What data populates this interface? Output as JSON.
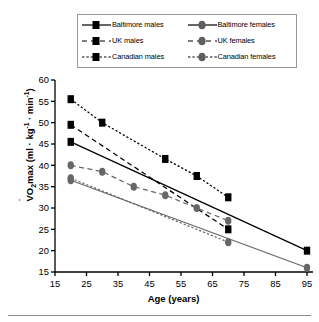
{
  "chart_data": {
    "type": "line",
    "title": "",
    "xlabel": "Age (years)",
    "ylabel": "VO2max (ml · kg-1 · min-1)",
    "ylabel_main": "O",
    "ylabel_pre": "V",
    "ylabel_sub": "2",
    "ylabel_rest": "max (ml · kg",
    "ylabel_sup1": "-1",
    "ylabel_mid": " · min",
    "ylabel_sup2": "-1",
    "ylabel_end": ")",
    "xlim": [
      15,
      95
    ],
    "ylim": [
      15,
      60
    ],
    "xticks": [
      15,
      25,
      35,
      45,
      55,
      65,
      75,
      85,
      95
    ],
    "yticks": [
      15,
      20,
      25,
      30,
      35,
      40,
      45,
      50,
      55,
      60
    ],
    "grid": false,
    "legend_position": "top-center",
    "series": [
      {
        "name": "Baltimore males",
        "marker": "square",
        "color": "#000000",
        "linestyle": "solid",
        "x": [
          20,
          95
        ],
        "y": [
          45.5,
          20.0
        ]
      },
      {
        "name": "UK males",
        "marker": "square",
        "color": "#000000",
        "linestyle": "dashed",
        "x": [
          20,
          70
        ],
        "y": [
          49.5,
          25.0
        ]
      },
      {
        "name": "Canadian males",
        "marker": "square",
        "color": "#000000",
        "linestyle": "dotted",
        "x": [
          20,
          30,
          50,
          60,
          70
        ],
        "y": [
          55.5,
          50.0,
          41.5,
          37.5,
          32.5
        ]
      },
      {
        "name": "Baltimore females",
        "marker": "circle",
        "color": "#676767",
        "linestyle": "solid",
        "x": [
          20,
          95
        ],
        "y": [
          36.5,
          16.0
        ]
      },
      {
        "name": "UK females",
        "marker": "circle",
        "color": "#676767",
        "linestyle": "dashed",
        "x": [
          20,
          30,
          40,
          50,
          60,
          70
        ],
        "y": [
          40.0,
          38.5,
          35.0,
          33.0,
          30.0,
          27.0
        ]
      },
      {
        "name": "Canadian females",
        "marker": "circle",
        "color": "#676767",
        "linestyle": "dotted",
        "x": [
          20,
          70
        ],
        "y": [
          37.0,
          22.0
        ]
      }
    ]
  },
  "legend": {
    "items": [
      {
        "label": "Baltimore males",
        "key": "solid-square-key"
      },
      {
        "label": "Baltimore females",
        "key": "solid-circle-key"
      },
      {
        "label": "UK males",
        "key": "dashed-square-key"
      },
      {
        "label": "UK females",
        "key": "dashed-circle-key"
      },
      {
        "label": "Canadian males",
        "key": "dotted-square-key"
      },
      {
        "label": "Canadian females",
        "key": "dotted-circle-key"
      }
    ]
  },
  "axes": {
    "x_title": "Age (years)",
    "x_tick_labels": [
      "15",
      "25",
      "35",
      "45",
      "55",
      "65",
      "75",
      "85",
      "95"
    ],
    "y_tick_labels": [
      "15",
      "20",
      "25",
      "30",
      "35",
      "40",
      "45",
      "50",
      "55",
      "60"
    ]
  },
  "colors": {
    "male": "#000000",
    "female": "#676767",
    "axis": "#000000",
    "legend_border": "#9a9a9a",
    "rule": "#8d8d8d"
  }
}
